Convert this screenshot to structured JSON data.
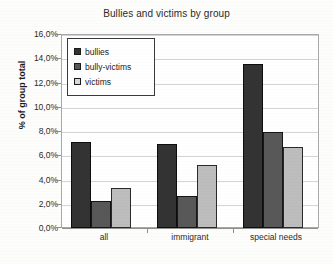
{
  "chart_data": {
    "type": "bar",
    "title": "Bullies and victims by group",
    "xlabel": "",
    "ylabel": "% of group total",
    "categories": [
      "all",
      "immigrant",
      "special needs"
    ],
    "series": [
      {
        "name": "bullies",
        "values": [
          7.1,
          6.9,
          13.5
        ],
        "color": "#333333"
      },
      {
        "name": "bully-victims",
        "values": [
          2.2,
          2.6,
          7.9
        ],
        "color": "#585858"
      },
      {
        "name": "victims",
        "values": [
          3.3,
          5.2,
          6.7
        ],
        "color": "#bdbdbd"
      }
    ],
    "ylim": [
      0,
      16
    ],
    "ytick_step": 2,
    "ytick_labels": [
      "16,0%",
      "14,0%",
      "12,0%",
      "10,0%",
      "8,0%",
      "6,0%",
      "4,0%",
      "2,0%",
      "0,0%"
    ],
    "ytick_values": [
      16,
      14,
      12,
      10,
      8,
      6,
      4,
      2,
      0
    ],
    "grid": true,
    "legend_position": "upper-left-inside",
    "value_format": "percent-comma-decimal"
  }
}
